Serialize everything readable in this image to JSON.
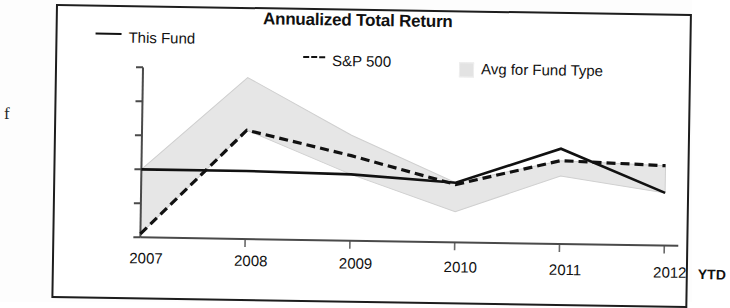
{
  "artifact": {
    "page_bleed_glyph": "f"
  },
  "chart_data": {
    "type": "line",
    "title": "Annualized Total Return",
    "xlabel": "",
    "ylabel": "",
    "x": [
      "2007",
      "2008",
      "2009",
      "2010",
      "2011",
      "2012"
    ],
    "x_axis_note": "YTD",
    "categories": [
      "2007",
      "2008",
      "2009",
      "2010",
      "2011",
      "2012"
    ],
    "ylim": [
      -40,
      60
    ],
    "yticks": [
      60,
      40,
      20,
      0,
      -20,
      -40
    ],
    "ytick_labels": [
      "60%",
      "40%",
      "20%",
      "0%",
      "-20%",
      "-40%"
    ],
    "grid": false,
    "legend_position": "top",
    "series": [
      {
        "name": "This Fund",
        "style": "solid",
        "color": "#111111",
        "values": [
          0,
          0,
          -1,
          -5,
          16,
          -9
        ]
      },
      {
        "name": "S&P 500",
        "style": "dashed",
        "color": "#111111",
        "values": [
          -38,
          24,
          10,
          -6,
          9,
          7
        ]
      },
      {
        "name": "Avg for Fund Type",
        "style": "band",
        "color": "#e3e3e3",
        "band_upper": [
          0,
          55,
          22,
          -5,
          9,
          7
        ],
        "band_lower": [
          -38,
          24,
          -1,
          -22,
          0,
          -9
        ]
      }
    ]
  },
  "legend": [
    {
      "label": "This Fund",
      "marker": "solid-line-marker"
    },
    {
      "label": "S&P 500",
      "marker": "dashed-line-marker"
    },
    {
      "label": "Avg for Fund Type",
      "marker": "gray-swatch-marker"
    }
  ]
}
